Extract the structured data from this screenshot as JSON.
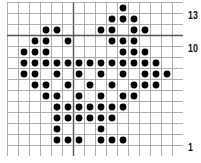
{
  "chart": {
    "type": "knitting-stitch-chart",
    "columns": 16,
    "rows": 14,
    "cell_size": 11,
    "grid_color": "#9a9a9a",
    "thick_line_color": "#555555",
    "dot_color": "#000000",
    "thick_horizontal_after_rows": [
      3
    ],
    "thick_vertical_after_cols": [
      6
    ],
    "row_labels": [
      {
        "row_index": 1,
        "text": "13"
      },
      {
        "row_index": 4,
        "text": "10"
      },
      {
        "row_index": 13,
        "text": "1"
      }
    ],
    "filled_cells": [
      [
        10
      ],
      [
        9,
        10,
        11
      ],
      [
        3,
        4,
        8,
        9,
        11,
        12
      ],
      [
        2,
        3,
        5,
        9,
        10,
        11
      ],
      [
        1,
        2,
        3,
        10,
        11,
        12
      ],
      [
        1,
        2,
        3,
        4,
        5,
        6,
        7,
        8,
        9,
        10,
        11,
        12,
        13
      ],
      [
        1,
        2,
        4,
        6,
        8,
        10,
        12,
        13,
        14
      ],
      [
        2,
        3,
        5,
        7,
        9,
        11,
        12,
        13
      ],
      [
        3,
        4,
        6,
        8,
        10,
        11
      ],
      [
        4,
        5,
        6,
        7,
        8,
        9,
        10
      ],
      [
        4,
        5,
        6,
        7,
        8,
        9
      ],
      [
        4,
        8
      ],
      [
        4,
        5,
        6,
        8,
        9,
        10
      ],
      []
    ]
  }
}
